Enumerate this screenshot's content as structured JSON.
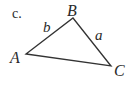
{
  "figure": {
    "part_label": "c.",
    "triangle": {
      "stroke_color": "#333333",
      "vertices": [
        {
          "name": "A",
          "x": 26,
          "y": 54
        },
        {
          "name": "B",
          "x": 73,
          "y": 18
        },
        {
          "name": "C",
          "x": 111,
          "y": 66
        }
      ],
      "sides": [
        {
          "name": "b",
          "between": [
            "A",
            "B"
          ]
        },
        {
          "name": "a",
          "between": [
            "B",
            "C"
          ]
        }
      ]
    },
    "labels": {
      "vertex_a": "A",
      "vertex_b": "B",
      "vertex_c": "C",
      "side_a": "a",
      "side_b": "b"
    }
  }
}
